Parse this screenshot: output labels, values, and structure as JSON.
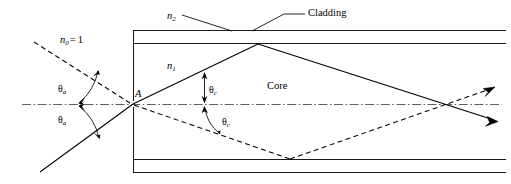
{
  "figure": {
    "colors": {
      "stroke": "#000000",
      "axis": "#555555",
      "background": "#ffffff"
    },
    "labels": {
      "cladding": "Cladding",
      "core": "Core",
      "n_cladding": "n",
      "n_cladding_sub": "2",
      "n_core": "n",
      "n_core_sub": "1",
      "n_outside": "n",
      "n_outside_sub": "0",
      "n_outside_eq": "=",
      "n_outside_value": "1",
      "point_a": "A",
      "theta": "θ",
      "theta_a_sub": "a",
      "theta_c_sub": "c"
    },
    "annotations": [
      {
        "name": "theta-a-upper",
        "symbol": "θ",
        "subscript": "a",
        "x": 60,
        "y": 86
      },
      {
        "name": "theta-a-lower",
        "symbol": "θ",
        "subscript": "a",
        "x": 60,
        "y": 117
      },
      {
        "name": "theta-c-upper",
        "symbol": "θ",
        "subscript": "c",
        "x": 209,
        "y": 87
      },
      {
        "name": "theta-c-lower",
        "symbol": "θ",
        "subscript": "c",
        "x": 216,
        "y": 119
      }
    ],
    "geometry": {
      "fiber_left_x": 133,
      "fiber_right_x": 503,
      "cladding_top_y": 30,
      "core_top_y": 43,
      "axis_y": 104,
      "core_bottom_y": 159,
      "cladding_bottom_y": 172,
      "entry_point": {
        "x": 133,
        "y": 104
      },
      "solid_ray_vertices": [
        {
          "x": 40,
          "y": 172
        },
        {
          "x": 133,
          "y": 104
        },
        {
          "x": 258,
          "y": 44
        },
        {
          "x": 443,
          "y": 104
        },
        {
          "x": 500,
          "y": 123
        }
      ],
      "dashed_incident_vertices": [
        {
          "x": 34,
          "y": 42
        },
        {
          "x": 133,
          "y": 104
        }
      ],
      "dashed_refracted_vertices": [
        {
          "x": 133,
          "y": 104
        },
        {
          "x": 290,
          "y": 160
        },
        {
          "x": 445,
          "y": 104
        },
        {
          "x": 494,
          "y": 87
        }
      ],
      "leader_lines": [
        {
          "name": "n2-leader",
          "x1": 182,
          "y1": 17,
          "x2": 232,
          "y2": 31
        },
        {
          "name": "cladding-leader-left",
          "x1": 251,
          "y1": 31,
          "x2": 287,
          "y2": 14
        },
        {
          "name": "cladding-leader-right",
          "x1": 287,
          "y1": 14,
          "x2": 303,
          "y2": 14
        }
      ]
    }
  }
}
